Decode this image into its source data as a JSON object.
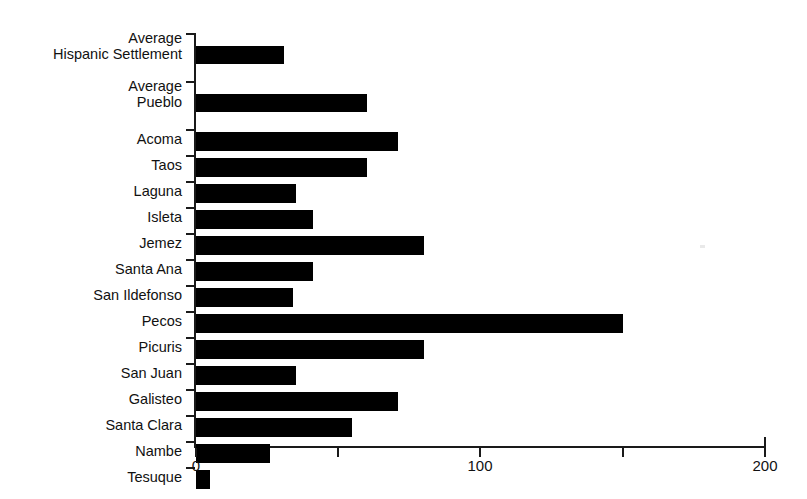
{
  "chart_data": {
    "type": "bar",
    "orientation": "horizontal",
    "title": "",
    "subtitle": "",
    "xlabel": "",
    "ylabel": "",
    "xlim": [
      0,
      200
    ],
    "xticks": [
      0,
      50,
      100,
      150,
      200
    ],
    "xtick_labels": [
      "0",
      "",
      "100",
      "",
      "200"
    ],
    "grid": false,
    "legend": null,
    "bar_color": "#000000",
    "axis_color": "#1a1a1a",
    "categories": [
      "Average\nHispanic Settlement",
      "Average\nPueblo",
      "Acoma",
      "Taos",
      "Laguna",
      "Isleta",
      "Jemez",
      "Santa Ana",
      "San Ildefonso",
      "Pecos",
      "Picuris",
      "San Juan",
      "Galisteo",
      "Santa Clara",
      "Nambe",
      "Tesuque"
    ],
    "values": [
      31,
      60,
      71,
      60,
      35,
      41,
      80,
      41,
      34,
      150,
      80,
      35,
      71,
      55,
      26,
      5
    ]
  }
}
